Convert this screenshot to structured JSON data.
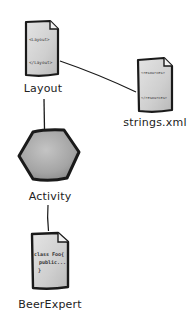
{
  "diagram": {
    "type": "component-relationship",
    "nodes": [
      {
        "id": "layout",
        "label": "Layout",
        "shape": "document",
        "content_lines": [
          "<Layout>",
          "</Layout>"
        ]
      },
      {
        "id": "strings",
        "label": "strings.xml",
        "shape": "document",
        "content_lines": [
          "<resources>",
          "</resources>"
        ]
      },
      {
        "id": "activity",
        "label": "Activity",
        "shape": "hexagon"
      },
      {
        "id": "beerexpert",
        "label": "BeerExpert",
        "shape": "document",
        "content_lines": [
          "class Foo{",
          "public...",
          "}"
        ]
      }
    ],
    "edges": [
      {
        "from": "layout",
        "to": "strings"
      },
      {
        "from": "layout",
        "to": "activity"
      },
      {
        "from": "activity",
        "to": "beerexpert"
      }
    ],
    "colors": {
      "doc_fill": "#d6d6d6",
      "doc_stroke": "#1a1a1a",
      "hexagon_fill": "#a8a8a8",
      "hexagon_stroke": "#1a1a1a",
      "line": "#1a1a1a",
      "label_text": "#222222"
    }
  }
}
